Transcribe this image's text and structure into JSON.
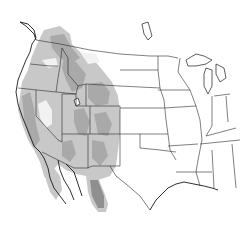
{
  "figure": {
    "type": "distribution-map",
    "region": "Western and Central United States with northern Mexico",
    "background_color": "#ffffff",
    "outline_color": "#1a1a1a",
    "shading": {
      "light": "#c8c8c8",
      "mid": "#a9a9a9",
      "dark": "#8f8f8f"
    },
    "labels": []
  }
}
